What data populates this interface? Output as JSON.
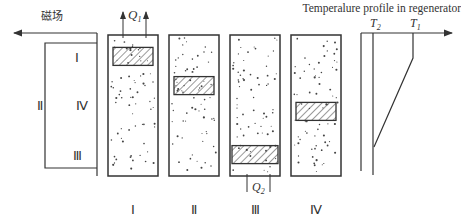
{
  "diagram": {
    "magnetic_field_label": "磁场",
    "cycle_loop_labels": {
      "top": "Ⅰ",
      "left": "Ⅱ",
      "middle": "Ⅳ",
      "bottom": "Ⅲ"
    },
    "heat_out_label": "Q",
    "heat_out_subscript": "1",
    "heat_in_label": "Q",
    "heat_in_subscript": "2",
    "stages": [
      {
        "label": "Ⅰ",
        "block_position": 0.08
      },
      {
        "label": "Ⅱ",
        "block_position": 0.33
      },
      {
        "label": "Ⅲ",
        "block_position": 0.92
      },
      {
        "label": "Ⅳ",
        "block_position": 0.55
      }
    ],
    "temperature_profile": {
      "title": "Temperalure profile in regenerator",
      "t2_label": "T",
      "t2_subscript": "2",
      "t1_label": "T",
      "t1_subscript": "1"
    },
    "colors": {
      "line": "#333333",
      "hatch": "#555555"
    }
  }
}
